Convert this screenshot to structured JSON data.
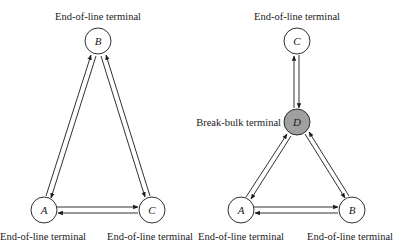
{
  "diagrams": [
    {
      "name": "point-to-point-network",
      "nodes": [
        {
          "id": "B",
          "label": "B",
          "caption": "End-of-line terminal",
          "x": 98,
          "y": 41,
          "fill": "#ffffff"
        },
        {
          "id": "A",
          "label": "A",
          "caption": "End-of-line terminal",
          "x": 44,
          "y": 210,
          "fill": "#ffffff"
        },
        {
          "id": "C",
          "label": "C",
          "caption": "End-of-line terminal",
          "x": 152,
          "y": 210,
          "fill": "#ffffff"
        }
      ],
      "edges": [
        {
          "from": "A",
          "to": "B",
          "bidirectional": true
        },
        {
          "from": "B",
          "to": "C",
          "bidirectional": true
        },
        {
          "from": "A",
          "to": "C",
          "bidirectional": true
        }
      ]
    },
    {
      "name": "hub-network",
      "nodes": [
        {
          "id": "C",
          "label": "C",
          "caption": "End-of-line terminal",
          "x": 297,
          "y": 41,
          "fill": "#ffffff"
        },
        {
          "id": "D",
          "label": "D",
          "caption": "Break-bulk terminal",
          "x": 297,
          "y": 122,
          "fill": "#a0a0a0"
        },
        {
          "id": "A",
          "label": "A",
          "caption": "End-of-line terminal",
          "x": 241,
          "y": 210,
          "fill": "#ffffff"
        },
        {
          "id": "B",
          "label": "B",
          "caption": "End-of-line terminal",
          "x": 352,
          "y": 210,
          "fill": "#ffffff"
        }
      ],
      "edges": [
        {
          "from": "C",
          "to": "D",
          "bidirectional": true
        },
        {
          "from": "D",
          "to": "A",
          "bidirectional": true
        },
        {
          "from": "D",
          "to": "B",
          "bidirectional": true
        },
        {
          "from": "A",
          "to": "B",
          "bidirectional": true
        }
      ]
    }
  ],
  "labels": {
    "left_top": "End-of-line terminal",
    "left_bottom_a": "End-of-line terminal",
    "left_bottom_c": "End-of-line terminal",
    "right_top": "End-of-line terminal",
    "right_hub": "Break-bulk terminal",
    "right_bottom_a": "End-of-line terminal",
    "right_bottom_b": "End-of-line terminal",
    "node_left_b": "B",
    "node_left_a": "A",
    "node_left_c": "C",
    "node_right_c": "C",
    "node_right_d": "D",
    "node_right_a": "A",
    "node_right_b": "B"
  },
  "colors": {
    "stroke": "#1a1a1a",
    "hub_fill": "#a0a0a0",
    "node_fill": "#ffffff"
  }
}
